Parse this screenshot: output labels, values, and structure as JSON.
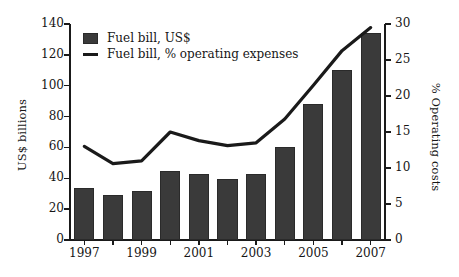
{
  "chart_data": {
    "type": "bar",
    "title": "",
    "subtitle": "",
    "xlabel": "",
    "ylabel": "US$ billions",
    "y2label": "% Operating costs",
    "categories": [
      "1997",
      "1998",
      "1999",
      "2000",
      "2001",
      "2002",
      "2003",
      "2004",
      "2005",
      "2006",
      "2007"
    ],
    "x_tick_labels": [
      "1997",
      "1999",
      "2001",
      "2003",
      "2005",
      "2007"
    ],
    "x_tick_years": [
      1997,
      1999,
      2001,
      2003,
      2005,
      2007
    ],
    "ylim": [
      0,
      140
    ],
    "y_ticks": [
      0,
      20,
      40,
      60,
      80,
      100,
      120,
      140
    ],
    "y2lim": [
      0,
      30
    ],
    "y2_ticks": [
      0,
      5,
      10,
      15,
      20,
      25,
      30
    ],
    "grid": false,
    "legend_position": "upper-left-inside",
    "series": [
      {
        "name": "Fuel bill, US$",
        "type": "bar",
        "axis": "left",
        "unit": "US$ billions",
        "color": "#3a3a3a",
        "values": [
          34,
          29,
          32,
          45,
          42.5,
          39.5,
          43,
          60.5,
          88,
          110,
          134
        ]
      },
      {
        "name": "Fuel bill, % operating expenses",
        "type": "line",
        "axis": "right",
        "unit": "% Operating costs",
        "color": "#1a1a1a",
        "values": [
          13.0,
          10.6,
          11.0,
          15.0,
          13.8,
          13.1,
          13.5,
          16.8,
          21.5,
          26.3,
          29.5
        ]
      }
    ]
  },
  "legend": {
    "items": [
      {
        "label": "Fuel bill, US$",
        "marker": "bar-swatch"
      },
      {
        "label": "Fuel bill, % operating expenses",
        "marker": "line-swatch"
      }
    ]
  },
  "axes": {
    "left_title": "US$ billions",
    "right_title": "% Operating costs"
  }
}
